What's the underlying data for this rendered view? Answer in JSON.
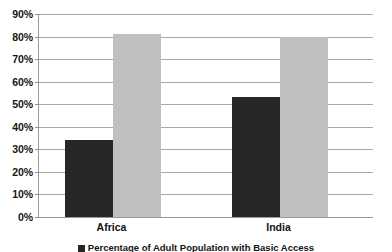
{
  "chart_data": {
    "type": "bar",
    "title": "",
    "subtitle": "",
    "xlabel": "",
    "ylabel": "",
    "categories": [
      "Africa",
      "India"
    ],
    "series": [
      {
        "name": "Percentage of Adult Population with Basic Access",
        "color": "#262626",
        "values": [
          34,
          53
        ]
      },
      {
        "name": "Percentage of Adult Population without Basic Access",
        "color": "#c0c0c0",
        "values": [
          81,
          80
        ]
      }
    ],
    "ylim": [
      0,
      90
    ],
    "ytick_step": 10,
    "ytick_labels": [
      "0%",
      "10%",
      "20%",
      "30%",
      "40%",
      "50%",
      "60%",
      "70%",
      "80%",
      "90%"
    ],
    "ytick_values": [
      0,
      10,
      20,
      30,
      40,
      50,
      60,
      70,
      80,
      90
    ],
    "grid": true,
    "grid_axis": "y",
    "legend_position": "bottom",
    "legend_clipped": true,
    "axis_line_color": "#9a9a9a",
    "gridline_color": "#a8a8a8",
    "background_color": "#ffffff",
    "text_color": "#151515"
  }
}
